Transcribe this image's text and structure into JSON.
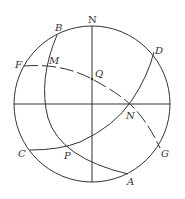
{
  "diagram": {
    "type": "celestial-sphere",
    "circle": {
      "cx": 92,
      "cy": 104,
      "r": 78
    },
    "labels": {
      "N_top": "N",
      "B": "B",
      "D": "D",
      "F": "F",
      "M": "M",
      "Q": "Q",
      "N_prime": "N",
      "C": "C",
      "P": "P",
      "G": "G",
      "A": "A"
    },
    "arcs": [
      {
        "name": "arc-B-A",
        "from": "B",
        "through": [
          "M",
          "P"
        ],
        "to": "A",
        "style": "solid"
      },
      {
        "name": "arc-C-D",
        "from": "C",
        "through": [
          "P",
          "N"
        ],
        "to": "D",
        "style": "solid"
      },
      {
        "name": "arc-F-G",
        "from": "F",
        "through": [
          "M",
          "Q",
          "N"
        ],
        "to": "G",
        "style": "dashed"
      }
    ],
    "axes": {
      "vertical": "N-S diameter",
      "horizontal": "E-W diameter"
    },
    "colors": {
      "stroke": "#333333",
      "background": "#ffffff"
    }
  }
}
